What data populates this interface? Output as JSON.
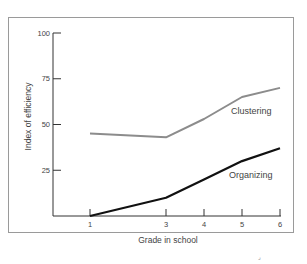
{
  "chart_data": {
    "type": "line",
    "title": "",
    "xlabel": "Grade in school",
    "ylabel": "Index of efficiency",
    "x": [
      1,
      3,
      4,
      5,
      6
    ],
    "x_tick_labels": [
      "1",
      "3",
      "4",
      "5",
      "6"
    ],
    "y_ticks": [
      25,
      50,
      75,
      100
    ],
    "y_tick_labels": [
      "25",
      "50",
      "75",
      "100"
    ],
    "ylim": [
      0,
      100
    ],
    "grid": false,
    "legend": "inline labels",
    "series": [
      {
        "name": "Clustering",
        "values": [
          45,
          43,
          53,
          65,
          70
        ],
        "color": "#8c8c8c"
      },
      {
        "name": "Organizing",
        "values": [
          0,
          10,
          20,
          30,
          37
        ],
        "color": "#111111"
      }
    ]
  }
}
